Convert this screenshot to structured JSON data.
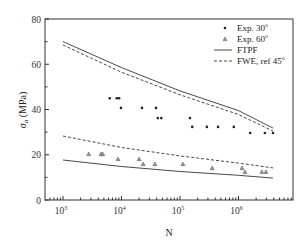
{
  "chart_data": {
    "type": "scatter",
    "title": "",
    "xlabel": "N",
    "ylabel": "σ_a (MPa)",
    "ylabel_main": "σ",
    "ylabel_sub": "a",
    "ylabel_unit": " (MPa)",
    "xscale": "log",
    "xlim_log10": [
      2.7,
      6.95
    ],
    "ylim": [
      0,
      80
    ],
    "grid": false,
    "legend_position": "upper right",
    "x_ticks": [
      {
        "exp": 3,
        "base": "10",
        "sup": "3"
      },
      {
        "exp": 4,
        "base": "10",
        "sup": "4"
      },
      {
        "exp": 5,
        "base": "10",
        "sup": "5"
      },
      {
        "exp": 6,
        "base": "10",
        "sup": "6"
      }
    ],
    "y_ticks": [
      0,
      20,
      40,
      60,
      80
    ],
    "y_minor_ticks": [
      10,
      30,
      50,
      70
    ],
    "series": [
      {
        "name": "Exp. 30°",
        "legend_base": "Exp. 30",
        "legend_sup": "o",
        "kind": "points",
        "marker": "dot",
        "points": [
          [
            6300,
            45
          ],
          [
            8300,
            45
          ],
          [
            9100,
            45
          ],
          [
            9800,
            40.7
          ],
          [
            22400,
            40.7
          ],
          [
            38900,
            40.7
          ],
          [
            41700,
            36.2
          ],
          [
            47900,
            36.2
          ],
          [
            148000,
            36.2
          ],
          [
            162000,
            32.3
          ],
          [
            288000,
            32.3
          ],
          [
            447000,
            32.3
          ],
          [
            832000,
            32.3
          ],
          [
            1580000,
            29.6
          ],
          [
            2820000,
            29.6
          ],
          [
            3890000,
            29.6
          ]
        ]
      },
      {
        "name": "Exp. 60°",
        "legend_base": "Exp. 60",
        "legend_sup": "o",
        "kind": "points",
        "marker": "triangle",
        "points": [
          [
            2750,
            20.3
          ],
          [
            4470,
            20.3
          ],
          [
            4790,
            20.3
          ],
          [
            8700,
            18.1
          ],
          [
            20000,
            18.1
          ],
          [
            23400,
            15.9
          ],
          [
            37200,
            15.9
          ],
          [
            112000,
            15.9
          ],
          [
            355000,
            14.1
          ],
          [
            1150000,
            14.1
          ],
          [
            1290000,
            12.4
          ],
          [
            2510000,
            12.4
          ],
          [
            2950000,
            12.4
          ]
        ]
      },
      {
        "name": "FTPF",
        "legend_base": "FTPF",
        "legend_sup": "",
        "kind": "line",
        "style": "solid",
        "curves": [
          {
            "id": "30deg",
            "points": [
              [
                1000,
                70
              ],
              [
                10000,
                58.5
              ],
              [
                100000,
                48.2
              ],
              [
                1000000,
                39.5
              ],
              [
                3890000,
                31.8
              ]
            ]
          },
          {
            "id": "60deg",
            "points": [
              [
                1000,
                17.7
              ],
              [
                10000,
                14.8
              ],
              [
                100000,
                12.6
              ],
              [
                1000000,
                10.9
              ],
              [
                3890000,
                9.7
              ]
            ]
          }
        ]
      },
      {
        "name": "FWE, ref 45°",
        "legend_base": "FWE, ref 45",
        "legend_sup": "o",
        "kind": "line",
        "style": "dashed",
        "curves": [
          {
            "id": "30deg",
            "points": [
              [
                1000,
                68.5
              ],
              [
                10000,
                56.5
              ],
              [
                100000,
                46.5
              ],
              [
                1000000,
                37.8
              ],
              [
                3890000,
                30.5
              ]
            ]
          },
          {
            "id": "60deg",
            "points": [
              [
                1000,
                28.3
              ],
              [
                10000,
                23.2
              ],
              [
                100000,
                19.5
              ],
              [
                1000000,
                16.3
              ],
              [
                3890000,
                14.2
              ]
            ]
          }
        ]
      }
    ]
  }
}
